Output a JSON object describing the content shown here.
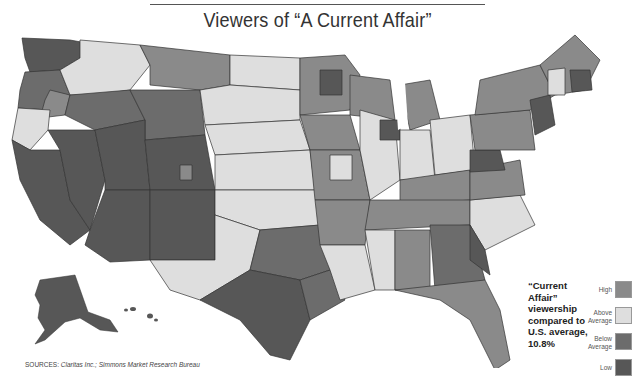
{
  "title": "Viewers of “A Current Affair”",
  "caption": {
    "line1": "“Current Affair”",
    "line2": "viewership",
    "line3": "compared to",
    "line4": "U.S. average,",
    "line5": "10.8%"
  },
  "legend": {
    "items": [
      {
        "label": "High",
        "color": "#8a8a8a"
      },
      {
        "label": "Above Average",
        "color": "#dedede"
      },
      {
        "label": "Below Average",
        "color": "#6c6c6c"
      },
      {
        "label": "Low",
        "color": "#575757"
      }
    ]
  },
  "sources": {
    "prefix": "SOURCES:",
    "text": "Claritas Inc.; Simmons Market Research Bureau"
  },
  "map": {
    "region_note": "Contiguous U.S. plus Alaska and Hawaii, shaded by TV market viewership category",
    "colors": {
      "high": "#8a8a8a",
      "above": "#dedede",
      "below": "#6c6c6c",
      "low": "#575757",
      "border": "#333333"
    }
  }
}
